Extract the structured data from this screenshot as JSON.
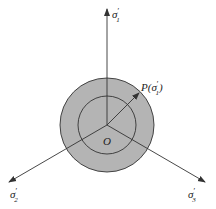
{
  "diagram": {
    "title": "",
    "origin_label": "O",
    "axes": [
      {
        "id": "sigma1",
        "symbol": "σ",
        "prime": "′",
        "subscript": "1",
        "direction": "up"
      },
      {
        "id": "sigma2",
        "symbol": "σ",
        "prime": "′",
        "subscript": "2",
        "direction": "lower-left"
      },
      {
        "id": "sigma3",
        "symbol": "σ",
        "prime": "′",
        "subscript": "3",
        "direction": "lower-right"
      }
    ],
    "vector": {
      "label_prefix": "P(",
      "symbol": "σ",
      "prime": "′",
      "subscript": "1",
      "label_suffix": ")"
    },
    "circles": [
      {
        "id": "outer",
        "role": "outer-ring"
      },
      {
        "id": "inner",
        "role": "inner-circle"
      }
    ],
    "colors": {
      "fill": "#b4b4b4",
      "stroke": "#333333",
      "background": "#ffffff",
      "text": "#222222"
    }
  }
}
